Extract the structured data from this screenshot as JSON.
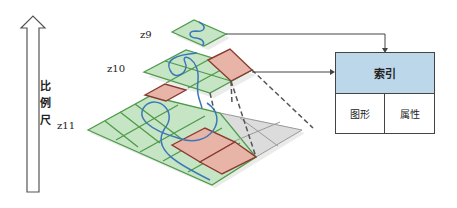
{
  "scale_axis": {
    "label_chars": [
      "比",
      "例",
      "尺"
    ],
    "direction": "up"
  },
  "layers": [
    {
      "id": "z9",
      "label": "z9"
    },
    {
      "id": "z10",
      "label": "z10"
    },
    {
      "id": "z11",
      "label": "z11"
    }
  ],
  "index_table": {
    "header": "索引",
    "cells": [
      "图形",
      "属性"
    ]
  },
  "colors": {
    "tile_green": "#c6e5c4",
    "tile_green_border": "#4e9a4a",
    "tile_red": "#e8b4a8",
    "tile_red_border": "#8a3a30",
    "tile_gray": "#dcdcdc",
    "curve_blue": "#3a78b8",
    "index_header_bg": "#bcd6ea"
  }
}
